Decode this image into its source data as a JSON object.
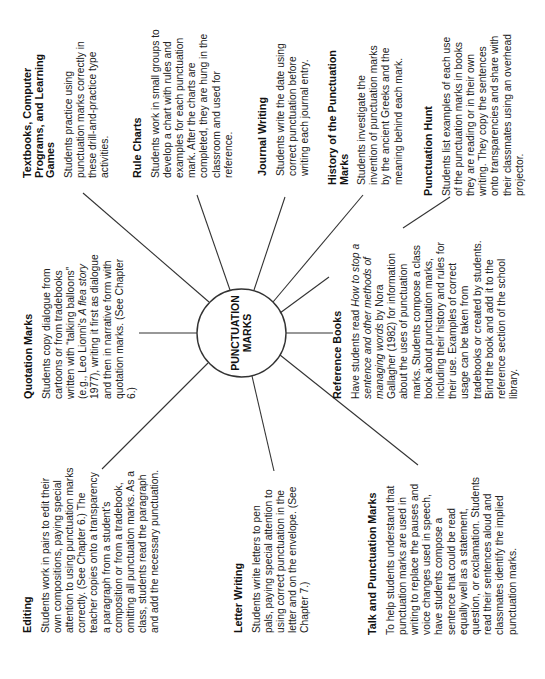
{
  "diagram": {
    "type": "web",
    "orientation": "rotated-90-ccw",
    "center": {
      "label_line1": "PUNCTUATION",
      "label_line2": "MARKS"
    },
    "nodes": [
      {
        "id": "textbooks",
        "title": "Textbooks, Computer Programs, and Learning Games",
        "body": "Students practice using punctuation marks correctly in these drill-and-practice type activities."
      },
      {
        "id": "rule-charts",
        "title": "Rule Charts",
        "body": "Students work in small groups to develop a chart with rules and examples for each punctuation mark. After the charts are completed, they are hung in the classroom and used for reference."
      },
      {
        "id": "journal-writing",
        "title": "Journal Writing",
        "body": "Students write the date using correct punctuation before writing each journal entry."
      },
      {
        "id": "history",
        "title": "History of the Punctuation Marks",
        "body": "Students investigate the invention of punctuation marks by the ancient Greeks and the meaning behind each mark."
      },
      {
        "id": "punctuation-hunt",
        "title": "Punctuation Hunt",
        "body": "Students list examples of each use of the punctuation marks in books they are reading or in their own writing. They copy the sentences onto transparencies and share with their classmates using an overhead projector."
      },
      {
        "id": "quotation-marks",
        "title": "Quotation Marks",
        "body_pre": "Students copy dialogue from cartoons or from tradebooks written with “talking balloons” (e.g., Leo Lionni's ",
        "body_italic": "A flea story",
        "body_post": " 1977), writing it first as dialogue and then in narrative form with quotation marks. (See Chapter 6.)"
      },
      {
        "id": "reference-books",
        "title": "Reference Books",
        "body_pre": "Have students read ",
        "body_italic": "How to stop a sentence and other methods of managing words",
        "body_post": " by Nora Gallagher (1982) for information about the uses of punctuation marks. Students compose a class book about punctuation marks, including their history and rules for their use. Examples of correct usage can be taken from tradebooks or created by students. Bind the book and add it to the reference section of the school library."
      },
      {
        "id": "editing",
        "title": "Editing",
        "body": "Students work in pairs to edit their own compositions, paying special attention to using punctuation marks correctly. (See Chapter 6.) The teacher copies onto a transparency a paragraph from a student's composition or from a tradebook, omitting all punctuation marks. As a class, students read the paragraph and add the necessary punctuation."
      },
      {
        "id": "letter-writing",
        "title": "Letter Writing",
        "body": "Students write letters to pen pals, paying special attention to using correct punctuation in the letter and on the envelope. (See Chapter 7.)"
      },
      {
        "id": "talk",
        "title": "Talk and Punctuation Marks",
        "body": "To help students understand that punctuation marks are used in writing to replace the pauses and voice changes used in speech, have students compose a sentence that could be read equally well as a statement, question, or exclamation. Students read their sentences aloud and classmates identify the implied punctuation marks."
      }
    ]
  },
  "colors": {
    "ink": "#222222",
    "line": "#333333",
    "background": "#ffffff"
  }
}
